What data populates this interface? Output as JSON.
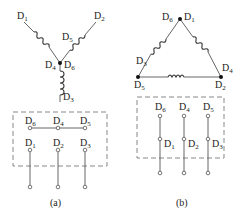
{
  "diagram": {
    "a": {
      "caption": "(a)",
      "connection": "star",
      "winding_labels": {
        "d1": {
          "main": "D",
          "sub": "1"
        },
        "d2": {
          "main": "D",
          "sub": "2"
        },
        "d3": {
          "main": "D",
          "sub": "3"
        },
        "d4": {
          "main": "D",
          "sub": "4"
        },
        "d5": {
          "main": "D",
          "sub": "5"
        },
        "d6": {
          "main": "D",
          "sub": "6"
        }
      },
      "terminal_box": {
        "top_row": [
          {
            "main": "D",
            "sub": "6"
          },
          {
            "main": "D",
            "sub": "4"
          },
          {
            "main": "D",
            "sub": "5"
          }
        ],
        "bottom_row": [
          {
            "main": "D",
            "sub": "1"
          },
          {
            "main": "D",
            "sub": "2"
          },
          {
            "main": "D",
            "sub": "3"
          }
        ]
      }
    },
    "b": {
      "caption": "(b)",
      "connection": "delta",
      "winding_labels": {
        "d6": {
          "main": "D",
          "sub": "6"
        },
        "d1": {
          "main": "D",
          "sub": "1"
        },
        "d3": {
          "main": "D",
          "sub": "3"
        },
        "d4": {
          "main": "D",
          "sub": "4"
        },
        "d5": {
          "main": "D",
          "sub": "5"
        },
        "d2": {
          "main": "D",
          "sub": "2"
        }
      },
      "terminal_box": {
        "top_row": [
          {
            "main": "D",
            "sub": "6"
          },
          {
            "main": "D",
            "sub": "4"
          },
          {
            "main": "D",
            "sub": "5"
          }
        ],
        "bottom_row": [
          {
            "main": "D",
            "sub": "1"
          },
          {
            "main": "D",
            "sub": "2"
          },
          {
            "main": "D",
            "sub": "3"
          }
        ]
      }
    }
  }
}
